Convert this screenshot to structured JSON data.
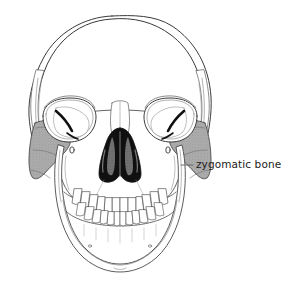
{
  "figure": {
    "kind": "anatomical-illustration",
    "background_color": "#ffffff",
    "line_color": "#3a3a3a",
    "highlight_color": "#a8a8a8",
    "cavity_color": "#101010",
    "turbinate_color": "#6e6e6e",
    "label_color": "#1c1c1c"
  },
  "annotations": [
    {
      "id": "zygomatic",
      "label": "zygomatic bone",
      "leader_line": {
        "x1": 181,
        "y1": 165,
        "x2": 193,
        "y2": 165
      },
      "label_position": {
        "x": 196,
        "y": 158
      }
    }
  ],
  "highlighted_structures": [
    {
      "name": "zygomatic bone (right side of image / subject left)",
      "shaded": true
    },
    {
      "name": "zygomatic bone (left side of image / subject right)",
      "shaded": true
    }
  ],
  "structures": [
    "frontal bone",
    "parietal bone",
    "temporal bone",
    "orbit",
    "nasal aperture",
    "nasal conchae",
    "maxilla",
    "mandible",
    "upper teeth",
    "lower teeth",
    "mental foramen"
  ]
}
